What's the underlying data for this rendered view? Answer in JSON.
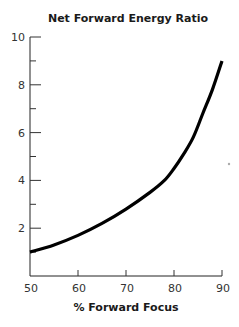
{
  "chart_data": {
    "type": "line",
    "title": "Net Forward Energy Ratio",
    "xlabel": "% Forward Focus",
    "ylabel": "",
    "xlim": [
      50,
      90
    ],
    "ylim": [
      0,
      10
    ],
    "x_ticks": [
      50,
      60,
      70,
      80,
      90
    ],
    "y_ticks_major": [
      2,
      4,
      6,
      8,
      10
    ],
    "y_ticks_minor": [
      1,
      3,
      5,
      7,
      9
    ],
    "grid": false,
    "legend": "none",
    "series": [
      {
        "name": "Net Forward Energy Ratio",
        "color": "#000000",
        "x": [
          50,
          55,
          60,
          65,
          70,
          75,
          78,
          80,
          82,
          84,
          86,
          88,
          90
        ],
        "y": [
          1.0,
          1.3,
          1.7,
          2.2,
          2.8,
          3.5,
          4.0,
          4.5,
          5.1,
          5.8,
          6.8,
          7.8,
          9.0
        ]
      }
    ]
  }
}
